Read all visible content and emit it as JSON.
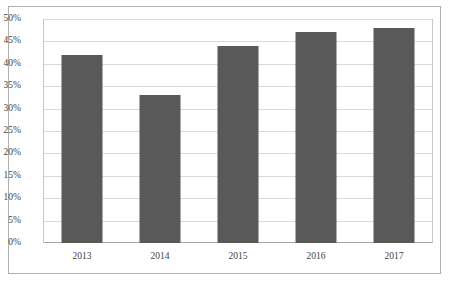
{
  "chart_data": {
    "type": "bar",
    "title": "",
    "subtitle": "",
    "xlabel": "",
    "ylabel": "",
    "categories": [
      "2013",
      "2014",
      "2015",
      "2016",
      "2017"
    ],
    "values": [
      42,
      33,
      44,
      47,
      48
    ],
    "value_labels": [
      "42%",
      "33%",
      "44%",
      "47%",
      "48%"
    ],
    "ylim": [
      0,
      50
    ],
    "ytick_values": [
      0,
      5,
      10,
      15,
      20,
      25,
      30,
      35,
      40,
      45,
      50
    ],
    "ytick_labels": [
      "0%",
      "5%",
      "10%",
      "15%",
      "20%",
      "25%",
      "30%",
      "35%",
      "40%",
      "45%",
      "50%"
    ],
    "grid": true,
    "legend": false,
    "legend_position": "none",
    "series": [
      {
        "name": "",
        "values": [
          42,
          33,
          44,
          47,
          48
        ]
      }
    ],
    "colors": {
      "bar_fill": "#595959",
      "gridline": "#d9d9d9",
      "axis_line": "#a8a8a8",
      "frame": "#b0b0b0",
      "tick_text": "#3f3f3f",
      "background": "#ffffff"
    }
  }
}
